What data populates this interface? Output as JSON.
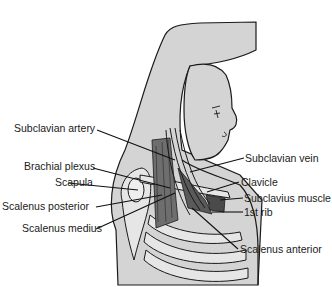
{
  "diagram": {
    "labels_left": [
      {
        "id": "subclavian-artery",
        "text": "Subclavian artery"
      },
      {
        "id": "brachial-plexus",
        "text": "Brachial plexus"
      },
      {
        "id": "scapula",
        "text": "Scapula"
      },
      {
        "id": "scalenus-posterior",
        "text": "Scalenus posterior"
      },
      {
        "id": "scalenus-medius",
        "text": "Scalenus medius"
      }
    ],
    "labels_right": [
      {
        "id": "subclavian-vein",
        "text": "Subclavian vein"
      },
      {
        "id": "clavicle",
        "text": "Clavicle"
      },
      {
        "id": "subclavius-muscle",
        "text": "Subclavius muscle"
      },
      {
        "id": "first-rib",
        "text": "1st rib"
      },
      {
        "id": "scalenus-anterior",
        "text": "Scalenus anterior"
      }
    ],
    "colors": {
      "skin": "#d4d4d4",
      "outline": "#1a1a1a",
      "muscle": "#6e6e6e",
      "muscle_dark": "#4a4a4a",
      "bone": "#e6e6e6"
    }
  }
}
